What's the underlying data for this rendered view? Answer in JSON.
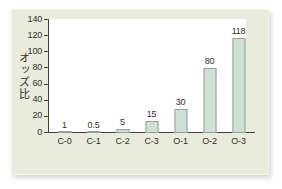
{
  "figure": {
    "panel_background": "#e9ebdc",
    "plot_background": "#ffffff",
    "axis_color": "#3d4338",
    "text_color": "#2f3329",
    "bar_fill": "#cfe0d5",
    "bar_stroke": "#8aa596"
  },
  "chart_data": {
    "type": "bar",
    "title": "",
    "subtitle": "",
    "xlabel": "",
    "ylabel": "オッズ比",
    "categories": [
      "C-0",
      "C-1",
      "C-2",
      "C-3",
      "O-1",
      "O-2",
      "O-3"
    ],
    "values": [
      1,
      0.5,
      5,
      15,
      30,
      80,
      118
    ],
    "value_labels": [
      "1",
      "0.5",
      "5",
      "15",
      "30",
      "80",
      "118"
    ],
    "ylim": [
      0,
      140
    ],
    "ytick_labels": [
      "0",
      "20",
      "40",
      "60",
      "80",
      "100",
      "120",
      "140"
    ],
    "ytick_values": [
      0,
      20,
      40,
      60,
      80,
      100,
      120,
      140
    ],
    "grid": false,
    "legend": false,
    "legend_position": "none"
  }
}
